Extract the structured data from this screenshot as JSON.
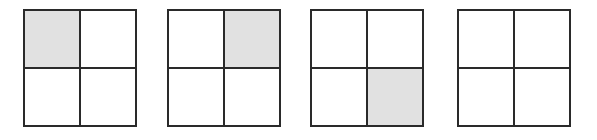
{
  "diagram": {
    "fill_color": "#e1e1e1",
    "line_color": "#2a2a2a",
    "grids": [
      {
        "left": 23,
        "filled": [
          "tl"
        ]
      },
      {
        "left": 167,
        "filled": [
          "tr"
        ]
      },
      {
        "left": 310,
        "filled": [
          "br"
        ]
      },
      {
        "left": 457,
        "filled": []
      }
    ]
  }
}
